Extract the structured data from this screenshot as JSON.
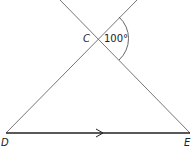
{
  "diagram": {
    "points": {
      "C": {
        "label": "C",
        "x": 97,
        "y": 38
      },
      "D": {
        "label": "D",
        "x": 6,
        "y": 133
      },
      "E": {
        "label": "E",
        "x": 190,
        "y": 133
      }
    },
    "angle": {
      "vertex": "C",
      "value": "100°"
    },
    "parallel_marker": "single arrow on DE",
    "colors": {
      "line": "#555555",
      "base": "#222222",
      "background": "#ffffff"
    }
  }
}
